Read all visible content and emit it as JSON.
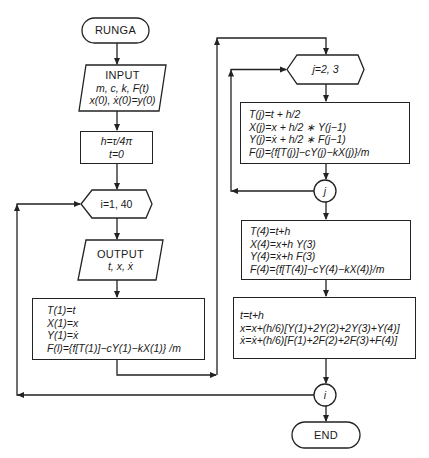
{
  "flowchart": {
    "start": {
      "label": "RUNGA"
    },
    "input": {
      "title": "INPUT",
      "line1": "m, c, k, F(t)",
      "line2": "x(0), ẋ(0)=y(0)"
    },
    "init": {
      "line1": "h=τ/4π",
      "line2": "t=0"
    },
    "loop_i": {
      "label": "i=1, 40"
    },
    "output": {
      "title": "OUTPUT",
      "line1": "t, x, ẋ"
    },
    "step1": {
      "lines": [
        "T(1)=t",
        "X(1)=x",
        "Y(1)=ẋ",
        "F(l)={f[T(1)]−cY(1)−kX(1)} /m"
      ]
    },
    "loop_j": {
      "label": "j=2, 3"
    },
    "stepj": {
      "lines": [
        "T(j)=t + h/2",
        "X(j)=x + h/2 ∗ Y(j−1)",
        "Y(j)=ẋ + h/2 ∗ F(j−1)",
        "F(j)={f[T(j)]−cY(j)−kX(j)}/m"
      ]
    },
    "connector_j": {
      "label": "j"
    },
    "step4": {
      "lines": [
        "T(4)=t+h",
        "X(4)=x+h Y(3)",
        "Y(4)=ẋ+h F(3)",
        "F(4)={f[T(4)]−cY(4)−kX(4)}/m"
      ]
    },
    "update": {
      "lines": [
        "t=t+h",
        "x=x+(h/6)[Y(1)+2Y(2)+2Y(3)+Y(4)]",
        "ẋ=ẋ+(h/6)[F(1)+2F(2)+2F(3)+F(4)]"
      ]
    },
    "connector_i": {
      "label": "i"
    },
    "end": {
      "label": "END"
    }
  }
}
